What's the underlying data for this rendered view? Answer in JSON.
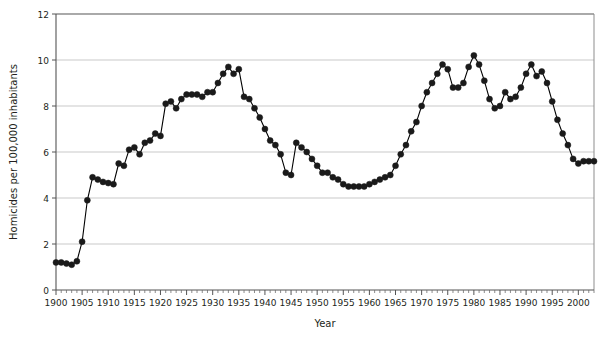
{
  "chart_data": {
    "type": "line",
    "title": "",
    "xlabel": "Year",
    "ylabel": "Homicides per 100,000 inhabitants",
    "xlim": [
      1900,
      2003
    ],
    "ylim": [
      0,
      12
    ],
    "ytick_values": [
      0,
      2,
      4,
      6,
      8,
      10,
      12
    ],
    "ytick_labels": [
      "0",
      "2",
      "4",
      "6",
      "8",
      "10",
      "12"
    ],
    "xtick_values": [
      1900,
      1905,
      1910,
      1915,
      1920,
      1925,
      1930,
      1935,
      1940,
      1945,
      1950,
      1955,
      1960,
      1965,
      1970,
      1975,
      1980,
      1985,
      1990,
      1995,
      2000
    ],
    "xtick_labels": [
      "1900",
      "1905",
      "1910",
      "1915",
      "1920",
      "1925",
      "1930",
      "1935",
      "1940",
      "1945",
      "1950",
      "1955",
      "1960",
      "1965",
      "1970",
      "1975",
      "1980",
      "1985",
      "1990",
      "1995",
      "2000"
    ],
    "minor_xtick_interval": 1,
    "grid": "horizontal",
    "legend": "none",
    "marker": "filled-circle",
    "line_color": "#000000",
    "marker_color": "#1a1a1a",
    "grid_color": "#c9c9c9",
    "axis_color": "#808080",
    "x": [
      1900,
      1901,
      1902,
      1903,
      1904,
      1905,
      1906,
      1907,
      1908,
      1909,
      1910,
      1911,
      1912,
      1913,
      1914,
      1915,
      1916,
      1917,
      1918,
      1919,
      1920,
      1921,
      1922,
      1923,
      1924,
      1925,
      1926,
      1927,
      1928,
      1929,
      1930,
      1931,
      1932,
      1933,
      1934,
      1935,
      1936,
      1937,
      1938,
      1939,
      1940,
      1941,
      1942,
      1943,
      1944,
      1945,
      1946,
      1947,
      1948,
      1949,
      1950,
      1951,
      1952,
      1953,
      1954,
      1955,
      1956,
      1957,
      1958,
      1959,
      1960,
      1961,
      1962,
      1963,
      1964,
      1965,
      1966,
      1967,
      1968,
      1969,
      1970,
      1971,
      1972,
      1973,
      1974,
      1975,
      1976,
      1977,
      1978,
      1979,
      1980,
      1981,
      1982,
      1983,
      1984,
      1985,
      1986,
      1987,
      1988,
      1989,
      1990,
      1991,
      1992,
      1993,
      1994,
      1995,
      1996,
      1997,
      1998,
      1999,
      2000,
      2001,
      2002,
      2003
    ],
    "y": [
      1.2,
      1.2,
      1.15,
      1.1,
      1.25,
      2.1,
      3.9,
      4.9,
      4.8,
      4.7,
      4.65,
      4.6,
      5.5,
      5.4,
      6.1,
      6.2,
      5.9,
      6.4,
      6.5,
      6.8,
      6.7,
      8.1,
      8.2,
      7.9,
      8.3,
      8.5,
      8.5,
      8.5,
      8.4,
      8.6,
      8.6,
      9.0,
      9.4,
      9.7,
      9.4,
      9.6,
      8.4,
      8.3,
      7.9,
      7.5,
      7.0,
      6.5,
      6.3,
      5.9,
      5.1,
      5.0,
      6.4,
      6.2,
      6.0,
      5.7,
      5.4,
      5.1,
      5.1,
      4.9,
      4.8,
      4.6,
      4.5,
      4.5,
      4.5,
      4.5,
      4.6,
      4.7,
      4.8,
      4.9,
      5.0,
      5.4,
      5.9,
      6.3,
      6.9,
      7.3,
      8.0,
      8.6,
      9.0,
      9.4,
      9.8,
      9.6,
      8.8,
      8.8,
      9.0,
      9.7,
      10.2,
      9.8,
      9.1,
      8.3,
      7.9,
      8.0,
      8.6,
      8.3,
      8.4,
      8.8,
      9.4,
      9.8,
      9.3,
      9.5,
      9.0,
      8.2,
      7.4,
      6.8,
      6.3,
      5.7,
      5.5,
      5.6,
      5.6,
      5.6
    ]
  },
  "axes": {
    "x_title": "Year",
    "y_title": "Homicides per 100,000 inhabitants"
  }
}
